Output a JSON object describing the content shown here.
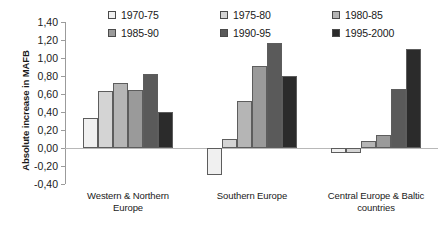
{
  "chart_data": {
    "type": "bar",
    "title": "",
    "xlabel": "",
    "ylabel": "Absolute increase in MAFB",
    "ylim": [
      -0.4,
      1.4
    ],
    "ytick_step": 0.2,
    "decimal_separator": ",",
    "grid": false,
    "legend_position": "top",
    "categories": [
      "Western & Northern Europe",
      "Southern Europe",
      "Central Europe & Baltic countries"
    ],
    "ytick_labels": [
      "1,40",
      "1,20",
      "1,00",
      "0,80",
      "0,60",
      "0,40",
      "0,20",
      "0,00",
      "-0,20",
      "-0,40"
    ],
    "ytick_values": [
      1.4,
      1.2,
      1.0,
      0.8,
      0.6,
      0.4,
      0.2,
      0.0,
      -0.2,
      -0.4
    ],
    "series": [
      {
        "name": "1970-75",
        "color": "#f0f0f0",
        "values": [
          0.33,
          -0.3,
          -0.06
        ]
      },
      {
        "name": "1975-80",
        "color": "#d4d4d4",
        "values": [
          0.63,
          0.1,
          -0.05
        ]
      },
      {
        "name": "1980-85",
        "color": "#b5b5b5",
        "values": [
          0.72,
          0.52,
          0.08
        ]
      },
      {
        "name": "1985-90",
        "color": "#9a9a9a",
        "values": [
          0.65,
          0.91,
          0.14
        ]
      },
      {
        "name": "1990-95",
        "color": "#5a5a5a",
        "values": [
          0.82,
          1.17,
          0.66
        ]
      },
      {
        "name": "1995-2000",
        "color": "#2b2b2b",
        "values": [
          0.4,
          0.8,
          1.1
        ]
      }
    ]
  }
}
